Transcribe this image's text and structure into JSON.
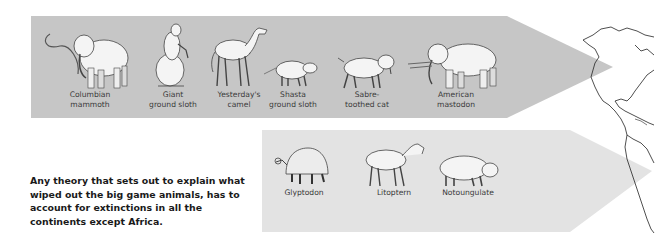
{
  "colors": {
    "top_arrow": "#c6c6c6",
    "bottom_arrow": "#e3e3e3",
    "text": "#1a1a1a"
  },
  "north_america": {
    "animals": [
      {
        "name": "Columbian mammoth",
        "label": "Columbian\nmammoth"
      },
      {
        "name": "Giant ground sloth",
        "label": "Giant\nground sloth"
      },
      {
        "name": "Yesterday's camel",
        "label": "Yesterday's\ncamel"
      },
      {
        "name": "Shasta ground sloth",
        "label": "Shasta\nground sloth"
      },
      {
        "name": "Sabre-toothed cat",
        "label": "Sabre-\ntoothed cat"
      },
      {
        "name": "American mastodon",
        "label": "American\nmastodon"
      }
    ]
  },
  "south_america": {
    "animals": [
      {
        "name": "Glyptodon",
        "label": "Glyptodon"
      },
      {
        "name": "Litoptern",
        "label": "Litoptern"
      },
      {
        "name": "Notoungulate",
        "label": "Notoungulate"
      }
    ]
  },
  "caption": "Any theory that sets out to explain what wiped out the big game animals, has to account for extinctions in all the continents except Africa."
}
